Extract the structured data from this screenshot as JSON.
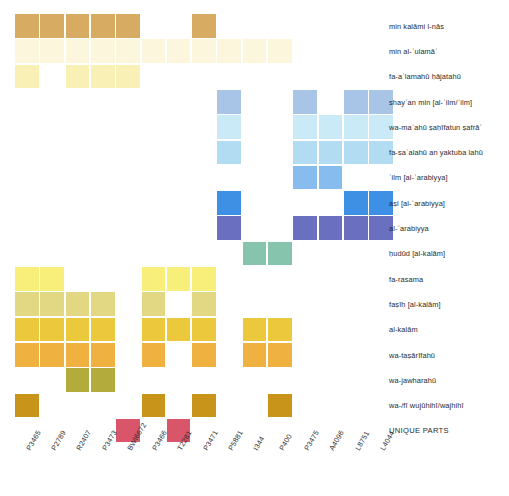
{
  "chart_data": {
    "type": "heatmap",
    "title": "",
    "xlabel": "",
    "ylabel": "",
    "grid": false,
    "legend": "none",
    "cell_size": 25.3,
    "origin": {
      "x": 15,
      "y": 14
    },
    "columns": [
      "P3465",
      "P2789",
      "R2407",
      "P3473",
      "BWl6672",
      "P3466",
      "T2281",
      "P3471",
      "P5881",
      "I344",
      "P400",
      "P3475",
      "A4096",
      "L8751",
      "L4044"
    ],
    "rows": [
      "min kalāmi l-nās",
      "min al-ʿulamāʾ",
      "fa-aʿlamahū ḥājatahū",
      "shayʾan min [al-ʿilm/ʿilm]",
      "wa-maʿahū ṣaḥīfatun ṣafrāʾ",
      "fa-saʾalahū an yaktuba lahū",
      "ʿilm [al-ʿarabiyya]",
      "aṣl [al-ʿarabiyya]",
      "al-ʿarabiyya",
      "ḥudūd [al-kalām]",
      "fa-rasama",
      "faṣīḥ [al-kalām]",
      "al-kalām",
      "wa-taṣārīfahū",
      "wa-jawharahū",
      "wa-/fī wujūhihī/wajhihī",
      "UNIQUE PARTS"
    ],
    "row_colors": [
      "#d7ab62",
      "#fbf6dc",
      "#f8f0b4",
      "#a8c4e6",
      "#caeaf8",
      "#b2dcf2",
      "#86bdee",
      "#3d90e3",
      "#6a70bf",
      "#86c4ae",
      "#f8ef7a",
      "#e2d884",
      "#ecc93c",
      "#efb13f",
      "#b3ab3c",
      "#c8941a",
      "#d9556a"
    ],
    "filled_cells": [
      {
        "row": 0,
        "cols": [
          0,
          1,
          2,
          3,
          4,
          7
        ]
      },
      {
        "row": 1,
        "cols": [
          0,
          1,
          2,
          3,
          4,
          5,
          6,
          7,
          8,
          9,
          10
        ]
      },
      {
        "row": 2,
        "cols": [
          0,
          2,
          3,
          4
        ]
      },
      {
        "row": 3,
        "cols": [
          8,
          11,
          13,
          14
        ]
      },
      {
        "row": 4,
        "cols": [
          8,
          11,
          12,
          13,
          14
        ]
      },
      {
        "row": 5,
        "cols": [
          8,
          11,
          12,
          13,
          14
        ]
      },
      {
        "row": 6,
        "cols": [
          11,
          12
        ]
      },
      {
        "row": 7,
        "cols": [
          8,
          13,
          14
        ]
      },
      {
        "row": 8,
        "cols": [
          8,
          11,
          12,
          13,
          14
        ]
      },
      {
        "row": 9,
        "cols": [
          9,
          10
        ]
      },
      {
        "row": 10,
        "cols": [
          0,
          1,
          5,
          6,
          7
        ]
      },
      {
        "row": 11,
        "cols": [
          0,
          1,
          2,
          3,
          5,
          7
        ]
      },
      {
        "row": 12,
        "cols": [
          0,
          1,
          2,
          3,
          5,
          6,
          7,
          9,
          10
        ]
      },
      {
        "row": 13,
        "cols": [
          0,
          1,
          2,
          3,
          5,
          7,
          9,
          10
        ]
      },
      {
        "row": 14,
        "cols": [
          2,
          3
        ]
      },
      {
        "row": 15,
        "cols": [
          0,
          5,
          7,
          10
        ]
      },
      {
        "row": 16,
        "cols": [
          4,
          6
        ]
      }
    ],
    "row_label_x": 389,
    "col_label_y": 448
  }
}
